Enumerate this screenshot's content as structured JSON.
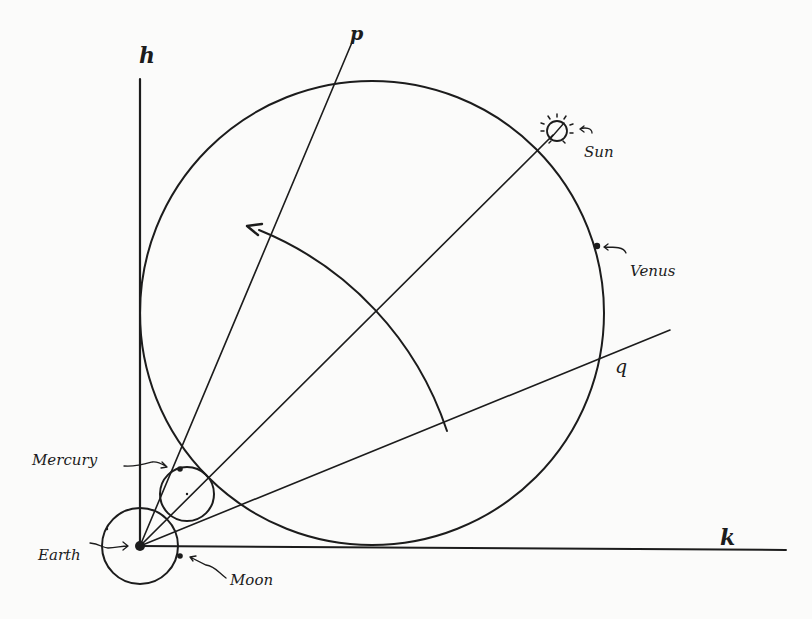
{
  "diagram": {
    "type": "geocentric orbital geometry sketch",
    "axis_labels": {
      "vertical": "h",
      "horizontal": "k",
      "line_p": "p",
      "line_q": "q"
    },
    "bodies": {
      "sun": "Sun",
      "venus": "Venus",
      "mercury": "Mercury",
      "earth": "Earth",
      "moon": "Moon"
    },
    "colors": {
      "ink": "#1c1c1c",
      "paper": "#fbfbfa"
    }
  }
}
